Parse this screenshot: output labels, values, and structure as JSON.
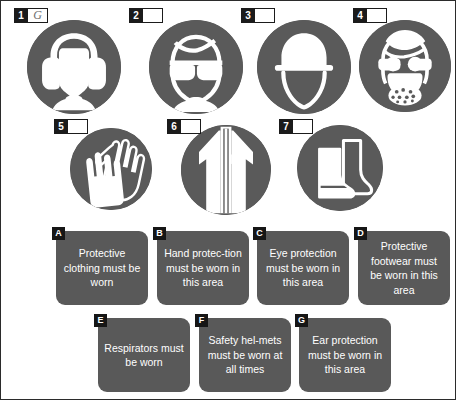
{
  "meta": {
    "page_background": "#ffffff",
    "disc_color": "#5a5a5a",
    "card_color": "#595959",
    "label_color": "#161616",
    "glyph_color": "#ffffff"
  },
  "signs": [
    {
      "number": "1",
      "answer": "G",
      "icon": "ear-protection-icon"
    },
    {
      "number": "2",
      "answer": "",
      "icon": "eye-protection-goggles-icon"
    },
    {
      "number": "3",
      "answer": "",
      "icon": "safety-helmet-icon"
    },
    {
      "number": "4",
      "answer": "",
      "icon": "respirator-mask-icon"
    },
    {
      "number": "5",
      "answer": "",
      "icon": "protective-gloves-icon"
    },
    {
      "number": "6",
      "answer": "",
      "icon": "protective-clothing-overalls-icon"
    },
    {
      "number": "7",
      "answer": "",
      "icon": "protective-footwear-boots-icon"
    }
  ],
  "cards": [
    {
      "letter": "A",
      "text": "Protective clothing must be worn"
    },
    {
      "letter": "B",
      "text": "Hand protec-tion must be worn in this area"
    },
    {
      "letter": "C",
      "text": "Eye protection must be worn in this area"
    },
    {
      "letter": "D",
      "text": "Protective footwear must be worn in this area"
    },
    {
      "letter": "E",
      "text": "Respirators must be worn"
    },
    {
      "letter": "F",
      "text": "Safety hel-mets must be worn at all times"
    },
    {
      "letter": "G",
      "text": "Ear protection must be worn in this area"
    }
  ]
}
